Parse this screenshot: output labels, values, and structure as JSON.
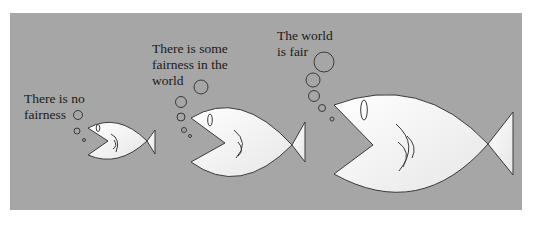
{
  "diagram": {
    "title": "",
    "background_color": "#a6a6a6",
    "fish_fill": "#f4f4f4",
    "stroke_color": "#333333",
    "fish": [
      {
        "id": "small",
        "thought": "There is no\nfairness",
        "size": "small"
      },
      {
        "id": "medium",
        "thought": "There is some\nfairness in the\nworld",
        "size": "medium"
      },
      {
        "id": "large",
        "thought": "The world\nis fair",
        "size": "large"
      }
    ]
  }
}
